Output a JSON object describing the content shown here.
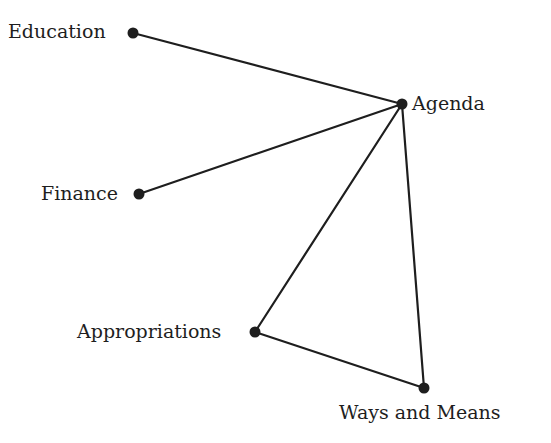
{
  "diagram": {
    "type": "network",
    "background": "#ffffff",
    "line_color": "#1e1e1e",
    "node_color": "#1e1e1e",
    "nodes": [
      {
        "id": "education",
        "label": "Education",
        "x": 133,
        "y": 33,
        "label_x": 8,
        "label_y": 22
      },
      {
        "id": "agenda",
        "label": "Agenda",
        "x": 402,
        "y": 104,
        "label_x": 412,
        "label_y": 94
      },
      {
        "id": "finance",
        "label": "Finance",
        "x": 139,
        "y": 194,
        "label_x": 41,
        "label_y": 184
      },
      {
        "id": "appropriations",
        "label": "Appropriations",
        "x": 255,
        "y": 332,
        "label_x": 77,
        "label_y": 322
      },
      {
        "id": "ways_and_means",
        "label": "Ways and Means",
        "x": 424,
        "y": 388,
        "label_x": 339,
        "label_y": 403
      }
    ],
    "edges": [
      {
        "from": "education",
        "to": "agenda"
      },
      {
        "from": "finance",
        "to": "agenda"
      },
      {
        "from": "appropriations",
        "to": "agenda"
      },
      {
        "from": "ways_and_means",
        "to": "agenda"
      },
      {
        "from": "appropriations",
        "to": "ways_and_means"
      }
    ]
  }
}
